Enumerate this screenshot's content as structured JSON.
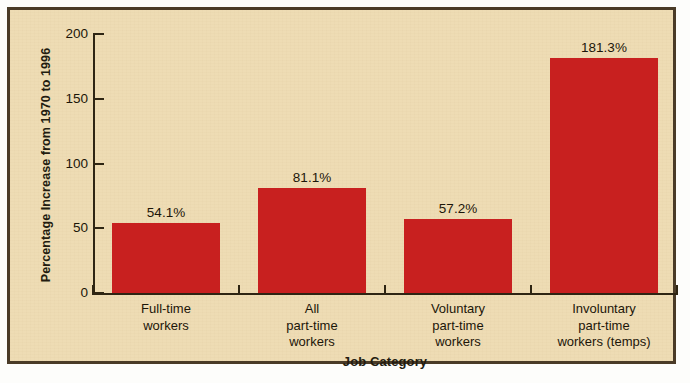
{
  "chart_data": {
    "type": "bar",
    "title": "",
    "subtitle": "",
    "xlabel": "Job Category",
    "ylabel": "Percentage Increase from 1970 to 1996",
    "categories": [
      "Full-time\nworkers",
      "All\npart-time\nworkers",
      "Voluntary\npart-time\nworkers",
      "Involuntary\npart-time\nworkers (temps)"
    ],
    "category_lines": [
      [
        "Full-time",
        "workers"
      ],
      [
        "All",
        "part-time",
        "workers"
      ],
      [
        "Voluntary",
        "part-time",
        "workers"
      ],
      [
        "Involuntary",
        "part-time",
        "workers (temps)"
      ]
    ],
    "values": [
      54.1,
      81.1,
      57.2,
      181.3
    ],
    "value_labels": [
      "54.1%",
      "81.1%",
      "57.2%",
      "181.3%"
    ],
    "ylim": [
      0,
      200
    ],
    "yticks": [
      0,
      50,
      100,
      150,
      200
    ],
    "ytick_labels": [
      "0",
      "50",
      "100",
      "150",
      "200"
    ],
    "grid": false,
    "legend": false,
    "legend_position": "none",
    "bar_color": "#c8201f",
    "background_color": "#eedcb4",
    "frame_color": "#4a3b27",
    "text_color": "#1c1609"
  }
}
